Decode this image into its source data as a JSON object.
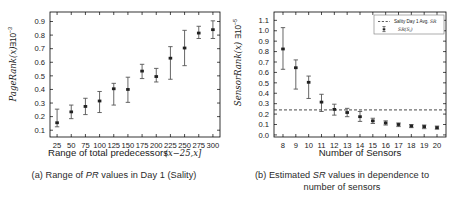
{
  "figure": {
    "panels": [
      {
        "id": "panel-a",
        "caption_prefix": "(a) Range of ",
        "caption_italic": "PR",
        "caption_suffix": " values in Day 1 (Sality)",
        "caption_full": "(a) Range of PR values in Day 1 (Sality)"
      },
      {
        "id": "panel-b",
        "caption_line1_prefix": "(b) Estimated ",
        "caption_line1_italic": "SR",
        "caption_line1_suffix": " values in dependence to",
        "caption_line2": "number of sensors",
        "caption_full": "(b) Estimated SR values in dependence to number of sensors"
      }
    ]
  },
  "chart_data": [
    {
      "type": "scatter",
      "id": "pagerank-range-chart",
      "title": "",
      "xlabel": "Range of total predecessors (x-25,x]",
      "xlabel_plain": "Range of total predecessors",
      "xlabel_math": "(x−25,x]",
      "ylabel": "PageRank(x) * 10^-3",
      "ylabel_main": "PageRank(x)",
      "ylabel_mult": "∃10",
      "ylabel_exp": "−3",
      "x": [
        25,
        50,
        75,
        100,
        125,
        150,
        175,
        200,
        225,
        250,
        275,
        300
      ],
      "xticklabels": [
        "25",
        "50",
        "75",
        "100",
        "125",
        "150",
        "175",
        "200",
        "225",
        "250",
        "275",
        "300"
      ],
      "yticklabels": [
        "0.1",
        "0.2",
        "0.3",
        "0.4",
        "0.5",
        "0.6",
        "0.7",
        "0.8",
        "0.9"
      ],
      "ylim": [
        0.05,
        0.97
      ],
      "ytick_values": [
        0.1,
        0.2,
        0.3,
        0.4,
        0.5,
        0.6,
        0.7,
        0.8,
        0.9
      ],
      "values": [
        0.155,
        0.235,
        0.275,
        0.315,
        0.405,
        0.4,
        0.535,
        0.495,
        0.63,
        0.705,
        0.815,
        0.84
      ],
      "err_low": [
        0.125,
        0.185,
        0.215,
        0.23,
        0.285,
        0.305,
        0.48,
        0.455,
        0.475,
        0.575,
        0.775,
        0.775
      ],
      "err_high": [
        0.255,
        0.285,
        0.335,
        0.385,
        0.445,
        0.49,
        0.585,
        0.555,
        0.715,
        0.835,
        0.865,
        0.905
      ],
      "grid": false,
      "legend": null
    },
    {
      "type": "scatter",
      "id": "sensorrank-sensors-chart",
      "title": "",
      "xlabel": "Number of Sensors",
      "ylabel": "SensorRank(x) * 10^-5",
      "ylabel_main": "SensorRank(x)",
      "ylabel_mult": "∃10",
      "ylabel_exp": "−5",
      "x": [
        8,
        9,
        10,
        11,
        12,
        13,
        14,
        15,
        16,
        17,
        18,
        19,
        20
      ],
      "xticklabels": [
        "8",
        "9",
        "10",
        "11",
        "12",
        "13",
        "14",
        "15",
        "16",
        "17",
        "18",
        "19",
        "20"
      ],
      "yticklabels": [
        "0.0",
        "0.1",
        "0.2",
        "0.3",
        "0.4",
        "0.5",
        "0.6",
        "0.7",
        "0.8",
        "0.9",
        "1.0",
        "1.1"
      ],
      "ytick_values": [
        0.0,
        0.1,
        0.2,
        0.3,
        0.4,
        0.5,
        0.6,
        0.7,
        0.8,
        0.9,
        1.0,
        1.1
      ],
      "ylim": [
        -0.02,
        1.18
      ],
      "values": [
        0.825,
        0.645,
        0.505,
        0.315,
        0.245,
        0.215,
        0.175,
        0.135,
        0.115,
        0.1,
        0.085,
        0.08,
        0.07
      ],
      "err_low": [
        0.63,
        0.44,
        0.35,
        0.225,
        0.19,
        0.175,
        0.13,
        0.11,
        0.095,
        0.08,
        0.07,
        0.06,
        0.055
      ],
      "err_high": [
        1.03,
        0.72,
        0.565,
        0.39,
        0.295,
        0.255,
        0.225,
        0.16,
        0.135,
        0.115,
        0.1,
        0.095,
        0.085
      ],
      "hline_value": 0.24,
      "grid": false,
      "legend": {
        "position": "upper-right",
        "entries": [
          {
            "label": "Sality Day 1 Avg. SR",
            "label_plain": "Sality Day 1 Avg. ",
            "label_italic": "SR",
            "marker": "dashed-line"
          },
          {
            "label": "SR(Si)",
            "label_plain": "SR(S",
            "label_sub": "i",
            "label_close": ")",
            "marker": "errorbar"
          }
        ]
      }
    }
  ]
}
